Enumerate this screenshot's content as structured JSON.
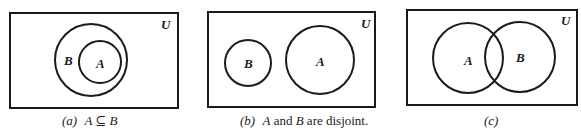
{
  "figure": {
    "panels": [
      {
        "id": "a",
        "universe_label": "U",
        "sets": [
          {
            "label": "B",
            "description": "outer circle"
          },
          {
            "label": "A",
            "description": "inner circle contained in B"
          }
        ],
        "caption_prefix": "(a)",
        "caption_text": "A ⊆ B"
      },
      {
        "id": "b",
        "universe_label": "U",
        "sets": [
          {
            "label": "B",
            "description": "small circle left"
          },
          {
            "label": "A",
            "description": "larger circle right, no overlap"
          }
        ],
        "caption_prefix": "(b)",
        "caption_A": "A",
        "caption_and": " and ",
        "caption_B": "B",
        "caption_rest": " are disjoint."
      },
      {
        "id": "c",
        "universe_label": "U",
        "sets": [
          {
            "label": "A",
            "description": "left circle"
          },
          {
            "label": "B",
            "description": "right circle overlapping A"
          }
        ],
        "caption_prefix": "(c)"
      }
    ],
    "colors": {
      "stroke": "#1a1a1a",
      "background": "#ffffff"
    }
  }
}
